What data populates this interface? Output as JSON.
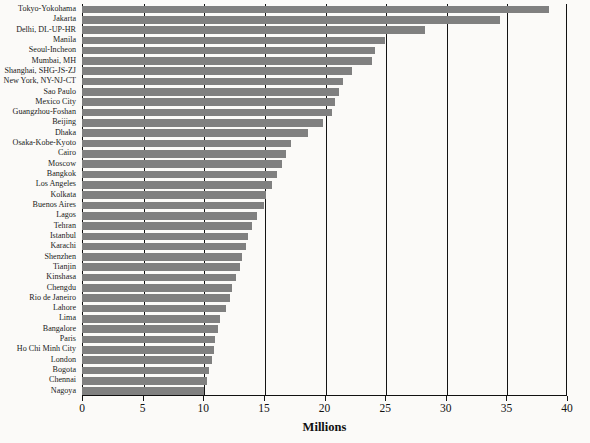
{
  "chart_data": {
    "type": "bar",
    "orientation": "horizontal",
    "title": "",
    "xlabel": "Millions",
    "ylabel": "",
    "xlim": [
      0,
      40
    ],
    "xticks": [
      0,
      5,
      10,
      15,
      20,
      25,
      30,
      35,
      40
    ],
    "xticklabels": [
      "0",
      "5",
      "10",
      "15",
      "20",
      "25",
      "30",
      "35",
      "40"
    ],
    "grid": "vertical",
    "legend": "none",
    "bar_color": "#808080",
    "background_color": "#fbfaf8",
    "axis_color": "#141414",
    "categories": [
      "Tokyo-Yokohama",
      "Jakarta",
      "Delhi, DL-UP-HR",
      "Manila",
      "Seoul-Incheon",
      "Mumbai, MH",
      "Shanghai, SHG-JS-ZJ",
      "New York, NY-NJ-CT",
      "Sao Paulo",
      "Mexico City",
      "Guangzhou-Foshan",
      "Beijing",
      "Dhaka",
      "Osaka-Kobe-Kyoto",
      "Cairo",
      "Moscow",
      "Bangkok",
      "Los Angeles",
      "Kolkata",
      "Buenos Aires",
      "Lagos",
      "Tehran",
      "Istanbul",
      "Karachi",
      "Shenzhen",
      "Tianjin",
      "Kinshasa",
      "Chengdu",
      "Rio de Janeiro",
      "Lahore",
      "Lima",
      "Bangalore",
      "Paris",
      "Ho Chi Minh City",
      "London",
      "Bogota",
      "Chennai",
      "Nagoya"
    ],
    "values": [
      38.5,
      34.5,
      28.3,
      25.0,
      24.2,
      23.9,
      22.3,
      21.5,
      21.2,
      20.9,
      20.6,
      19.9,
      18.6,
      17.2,
      16.8,
      16.5,
      16.1,
      15.7,
      15.2,
      15.0,
      14.4,
      14.0,
      13.7,
      13.5,
      13.2,
      13.0,
      12.7,
      12.4,
      12.2,
      11.9,
      11.4,
      11.2,
      11.0,
      10.9,
      10.7,
      10.5,
      10.3,
      10.1
    ]
  }
}
